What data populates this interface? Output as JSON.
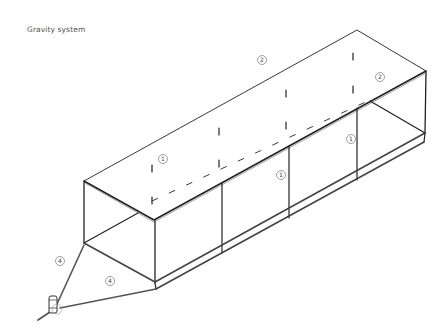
{
  "title": "Gravity system",
  "colors": {
    "line": "#222222",
    "pipe": "#444444",
    "label_circle": "#777777",
    "label_text": "#444444",
    "title_text": "#555555"
  },
  "labels": [
    {
      "id": "frame-label-1a",
      "text": "1",
      "x": 163,
      "y": 159
    },
    {
      "id": "frame-label-1b",
      "text": "1",
      "x": 281,
      "y": 175
    },
    {
      "id": "frame-label-1c",
      "text": "1",
      "x": 351,
      "y": 139
    },
    {
      "id": "roof-label-2a",
      "text": "2",
      "x": 262,
      "y": 60
    },
    {
      "id": "roof-label-2b",
      "text": "2",
      "x": 380,
      "y": 77
    },
    {
      "id": "pipe-label-4a",
      "text": "4",
      "x": 60,
      "y": 261
    },
    {
      "id": "pipe-label-4b",
      "text": "4",
      "x": 110,
      "y": 281
    }
  ]
}
